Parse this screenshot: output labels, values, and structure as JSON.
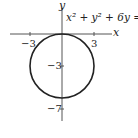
{
  "diagram": {
    "equation": "x² + y² + 6y = 0",
    "axis_x_label": "x",
    "axis_y_label": "y",
    "x_ticks": [
      "−3",
      "3"
    ],
    "y_ticks": [
      "−3",
      "−7"
    ],
    "circle": {
      "center": [
        0,
        -3
      ],
      "radius": 3
    }
  }
}
